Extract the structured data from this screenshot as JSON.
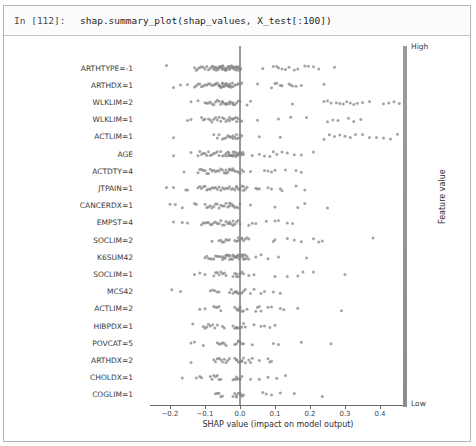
{
  "cell": {
    "prompt": "In [112]:",
    "code": "shap.summary_plot(shap_values, X_test[:100])"
  },
  "chart_data": {
    "type": "scatter",
    "subtype": "shap-beeswarm-summary",
    "title": "",
    "xlabel": "SHAP value (impact on model output)",
    "ylabel": "",
    "xlim": [
      -0.26,
      0.47
    ],
    "grid": false,
    "dot_color": "#858585",
    "zero_line_color": "#9a9a9a",
    "x_ticks": [
      {
        "v": -0.2,
        "label": "−0.2"
      },
      {
        "v": -0.1,
        "label": "−0.1"
      },
      {
        "v": 0.0,
        "label": "0.0"
      },
      {
        "v": 0.1,
        "label": "0.1"
      },
      {
        "v": 0.2,
        "label": "0.2"
      },
      {
        "v": 0.3,
        "label": "0.3"
      },
      {
        "v": 0.4,
        "label": "0.4"
      }
    ],
    "colorbar": {
      "high_label": "High",
      "low_label": "Low",
      "title": "Feature value",
      "color": "#949494"
    },
    "features": [
      {
        "label": "ARTHTYPE=-1",
        "points": [
          -0.21,
          -0.13,
          -0.125,
          -0.12,
          -0.115,
          -0.11,
          -0.105,
          -0.1,
          -0.095,
          -0.09,
          -0.085,
          -0.08,
          -0.078,
          -0.075,
          -0.072,
          -0.07,
          -0.068,
          -0.065,
          -0.062,
          -0.06,
          -0.058,
          -0.055,
          -0.052,
          -0.05,
          -0.048,
          -0.045,
          -0.042,
          -0.04,
          -0.038,
          -0.035,
          -0.032,
          -0.03,
          -0.028,
          -0.025,
          -0.022,
          -0.02,
          -0.018,
          -0.015,
          -0.012,
          -0.01,
          -0.008,
          -0.005,
          -0.003,
          0,
          -0.001,
          0.002,
          -0.02,
          -0.03,
          -0.04,
          -0.05,
          -0.01,
          0.065,
          0.095,
          0.105,
          0.11,
          0.12,
          0.13,
          0.14,
          0.155,
          0.165,
          0.185,
          0.195,
          0.21,
          0.225,
          0.27
        ]
      },
      {
        "label": "ARTHDX=1",
        "points": [
          -0.19,
          -0.17,
          -0.15,
          -0.13,
          -0.125,
          -0.12,
          -0.115,
          -0.11,
          -0.105,
          -0.1,
          -0.095,
          -0.09,
          -0.085,
          -0.08,
          -0.075,
          -0.07,
          -0.065,
          -0.06,
          -0.058,
          -0.055,
          -0.052,
          -0.05,
          -0.048,
          -0.045,
          -0.042,
          -0.04,
          -0.038,
          -0.035,
          -0.032,
          -0.03,
          -0.028,
          -0.025,
          -0.022,
          -0.02,
          -0.015,
          -0.01,
          -0.005,
          0,
          0.005,
          -0.06,
          -0.05,
          -0.04,
          -0.03,
          -0.07,
          0.05,
          0.09,
          0.1,
          0.105,
          0.115,
          0.12,
          0.14,
          0.145,
          0.15,
          0.16,
          0.175,
          0.24
        ]
      },
      {
        "label": "WLKLIM=2",
        "points": [
          -0.14,
          -0.12,
          -0.1,
          -0.095,
          -0.09,
          -0.085,
          -0.08,
          -0.075,
          -0.07,
          -0.065,
          -0.06,
          -0.055,
          -0.05,
          -0.045,
          -0.04,
          -0.035,
          -0.03,
          -0.025,
          -0.02,
          -0.015,
          -0.01,
          -0.005,
          0,
          -0.03,
          -0.04,
          -0.05,
          -0.02,
          0.02,
          0.03,
          0.15,
          0.24,
          0.25,
          0.26,
          0.275,
          0.285,
          0.295,
          0.305,
          0.315,
          0.325,
          0.335,
          0.35,
          0.37,
          0.41,
          0.425,
          0.44,
          0.455
        ]
      },
      {
        "label": "WLKLIM=1",
        "points": [
          -0.15,
          -0.14,
          -0.11,
          -0.105,
          -0.1,
          -0.09,
          -0.085,
          -0.08,
          -0.075,
          -0.07,
          -0.065,
          -0.06,
          -0.055,
          -0.05,
          -0.045,
          -0.04,
          -0.035,
          -0.03,
          -0.025,
          -0.02,
          -0.015,
          -0.01,
          -0.005,
          0,
          0.005,
          -0.02,
          -0.03,
          -0.01,
          0.05,
          0.11,
          0.145,
          0.19,
          0.25,
          0.265,
          0.28,
          0.31,
          0.325,
          0.345
        ]
      },
      {
        "label": "ACTLIM=1",
        "points": [
          -0.19,
          -0.075,
          -0.065,
          -0.06,
          -0.05,
          -0.045,
          -0.04,
          -0.035,
          -0.03,
          -0.025,
          -0.02,
          -0.015,
          -0.01,
          -0.005,
          0,
          0.005,
          -0.01,
          -0.02,
          -0.03,
          0,
          0.055,
          0.115,
          0.24,
          0.255,
          0.27,
          0.285,
          0.3,
          0.315,
          0.33,
          0.35,
          0.37,
          0.39,
          0.41,
          0.43,
          0.45
        ]
      },
      {
        "label": "AGE",
        "points": [
          -0.19,
          -0.14,
          -0.12,
          -0.115,
          -0.11,
          -0.105,
          -0.1,
          -0.095,
          -0.09,
          -0.085,
          -0.08,
          -0.075,
          -0.07,
          -0.065,
          -0.06,
          -0.055,
          -0.05,
          -0.045,
          -0.04,
          -0.038,
          -0.035,
          -0.032,
          -0.03,
          -0.028,
          -0.025,
          -0.022,
          -0.02,
          -0.018,
          -0.015,
          -0.012,
          -0.01,
          -0.008,
          -0.005,
          -0.002,
          0,
          0.003,
          0.005,
          0.008,
          0.01,
          -0.03,
          -0.02,
          -0.01,
          0,
          0.035,
          0.055,
          0.07,
          0.085,
          0.095,
          0.105,
          0.12,
          0.135,
          0.155,
          0.175,
          0.21
        ]
      },
      {
        "label": "ACTDTY=4",
        "points": [
          -0.16,
          -0.12,
          -0.115,
          -0.11,
          -0.105,
          -0.1,
          -0.095,
          -0.09,
          -0.085,
          -0.08,
          -0.075,
          -0.07,
          -0.065,
          -0.06,
          -0.055,
          -0.05,
          -0.045,
          -0.04,
          -0.035,
          -0.03,
          -0.025,
          -0.02,
          -0.015,
          -0.01,
          -0.005,
          0,
          0.005,
          0.01,
          -0.02,
          -0.03,
          -0.04,
          0.03,
          0.07,
          0.08,
          0.09,
          0.1,
          0.13,
          0.16,
          0.175
        ]
      },
      {
        "label": "JTPAIN=1",
        "points": [
          -0.21,
          -0.19,
          -0.155,
          -0.15,
          -0.12,
          -0.115,
          -0.11,
          -0.105,
          -0.1,
          -0.095,
          -0.09,
          -0.085,
          -0.08,
          -0.075,
          -0.07,
          -0.065,
          -0.06,
          -0.055,
          -0.05,
          -0.045,
          -0.04,
          -0.035,
          -0.03,
          -0.025,
          -0.02,
          -0.015,
          -0.01,
          -0.005,
          0,
          0.005,
          0.01,
          0.015,
          0.02,
          -0.01,
          0,
          0.01,
          0.045,
          0.05,
          0.055,
          0.08,
          0.09,
          0.115,
          0.12,
          0.16,
          0.185
        ]
      },
      {
        "label": "CANCERDX=1",
        "points": [
          -0.2,
          -0.185,
          -0.165,
          -0.13,
          -0.125,
          -0.1,
          -0.095,
          -0.09,
          -0.085,
          -0.08,
          -0.075,
          -0.07,
          -0.065,
          -0.06,
          -0.055,
          -0.05,
          -0.045,
          -0.04,
          -0.035,
          -0.03,
          -0.025,
          -0.02,
          -0.015,
          -0.01,
          -0.005,
          0,
          -0.02,
          -0.03,
          0.03,
          0.1,
          0.165,
          0.185,
          0.25
        ]
      },
      {
        "label": "EMPST=4",
        "points": [
          -0.19,
          -0.165,
          -0.15,
          -0.11,
          -0.105,
          -0.1,
          -0.095,
          -0.09,
          -0.085,
          -0.08,
          -0.075,
          -0.07,
          -0.065,
          -0.06,
          -0.055,
          -0.05,
          -0.045,
          -0.04,
          -0.035,
          -0.03,
          -0.025,
          -0.02,
          -0.015,
          -0.01,
          -0.005,
          0,
          -0.03,
          -0.02,
          0.025,
          0.035,
          0.045,
          0.075,
          0.1,
          0.11,
          0.135,
          0.15
        ]
      },
      {
        "label": "SOCLIM=2",
        "points": [
          -0.08,
          -0.06,
          -0.055,
          -0.05,
          -0.045,
          -0.04,
          -0.035,
          -0.03,
          -0.015,
          -0.01,
          -0.005,
          0,
          0.005,
          0.01,
          0.015,
          -0.005,
          0.005,
          0.02,
          0.025,
          0.095,
          0.1,
          0.135,
          0.155,
          0.175,
          0.21,
          0.225,
          0.235,
          0.38
        ]
      },
      {
        "label": "K6SUM42",
        "points": [
          -0.1,
          -0.095,
          -0.09,
          -0.085,
          -0.08,
          -0.075,
          -0.07,
          -0.065,
          -0.06,
          -0.055,
          -0.05,
          -0.048,
          -0.045,
          -0.042,
          -0.04,
          -0.038,
          -0.035,
          -0.032,
          -0.03,
          -0.028,
          -0.025,
          -0.022,
          -0.02,
          -0.018,
          -0.015,
          -0.012,
          -0.01,
          -0.008,
          -0.005,
          -0.002,
          0,
          0.003,
          0.005,
          0.008,
          0.01,
          0.013,
          0.015,
          0.018,
          0.02,
          0.025,
          -0.01,
          0,
          0.01,
          0.045,
          0.06,
          0.08,
          0.11,
          0.19
        ]
      },
      {
        "label": "SOCLIM=1",
        "points": [
          -0.13,
          -0.115,
          -0.1,
          -0.075,
          -0.07,
          -0.065,
          -0.06,
          -0.055,
          -0.05,
          -0.045,
          -0.04,
          -0.02,
          -0.015,
          -0.01,
          -0.005,
          0,
          0.005,
          0.01,
          -0.01,
          0,
          0.025,
          0.04,
          0.1,
          0.135,
          0.165,
          0.18,
          0.21,
          0.3
        ]
      },
      {
        "label": "MCS42",
        "points": [
          -0.195,
          -0.17,
          -0.085,
          -0.078,
          -0.072,
          -0.065,
          -0.06,
          -0.03,
          -0.025,
          -0.02,
          -0.015,
          -0.01,
          -0.005,
          0,
          0.005,
          0.01,
          0.015,
          -0.01,
          0,
          0.03,
          0.04,
          0.06,
          0.07,
          0.095,
          0.115
        ]
      },
      {
        "label": "ACTLIM=2",
        "points": [
          -0.115,
          -0.1,
          -0.075,
          -0.07,
          -0.065,
          -0.06,
          -0.055,
          -0.015,
          -0.01,
          -0.005,
          0,
          0.005,
          0.01,
          -0.005,
          0,
          0.02,
          0.045,
          0.05,
          0.055,
          0.06,
          0.08,
          0.09,
          0.115,
          0.125,
          0.165,
          0.29
        ]
      },
      {
        "label": "HIBPDX=1",
        "points": [
          -0.135,
          -0.105,
          -0.1,
          -0.095,
          -0.09,
          -0.085,
          -0.078,
          -0.072,
          -0.065,
          -0.05,
          -0.045,
          -0.02,
          -0.015,
          -0.01,
          -0.005,
          0,
          0.005,
          0.01,
          0.015,
          -0.01,
          0,
          0.04,
          0.06,
          0.07,
          0.085,
          0.1
        ]
      },
      {
        "label": "POVCAT=5",
        "points": [
          -0.14,
          -0.13,
          -0.105,
          -0.065,
          -0.06,
          -0.055,
          -0.05,
          -0.045,
          -0.04,
          -0.015,
          -0.01,
          -0.005,
          0,
          0.005,
          0.01,
          -0.005,
          0.035,
          0.095,
          0.11,
          0.175,
          0.26
        ]
      },
      {
        "label": "ARTHDX=2",
        "points": [
          -0.14,
          -0.075,
          -0.07,
          -0.065,
          -0.06,
          -0.055,
          -0.05,
          -0.045,
          -0.04,
          -0.035,
          -0.03,
          -0.015,
          -0.01,
          -0.005,
          0,
          0.005,
          0.01,
          0.015,
          -0.01,
          0,
          0.005,
          0.025,
          0.03,
          0.035,
          0.055,
          0.08,
          0.085,
          0.09
        ]
      },
      {
        "label": "CHOLDX=1",
        "points": [
          -0.165,
          -0.125,
          -0.115,
          -0.11,
          -0.085,
          -0.08,
          -0.075,
          -0.07,
          -0.065,
          -0.06,
          -0.055,
          -0.02,
          -0.015,
          -0.01,
          -0.005,
          0,
          0.005,
          -0.01,
          0,
          0.03,
          0.055,
          0.08,
          0.105,
          0.13
        ]
      },
      {
        "label": "COGLIM=1",
        "points": [
          -0.07,
          -0.065,
          -0.06,
          -0.055,
          -0.05,
          -0.02,
          -0.015,
          -0.01,
          -0.005,
          0,
          0.005,
          0.01,
          -0.01,
          0,
          0.005,
          0.065,
          0.075,
          0.09,
          0.115,
          0.155,
          0.235
        ]
      }
    ]
  }
}
